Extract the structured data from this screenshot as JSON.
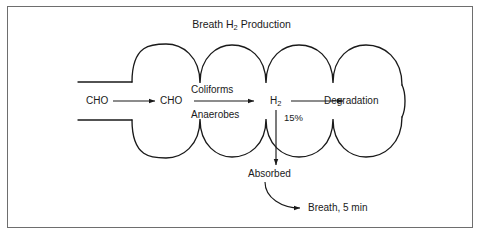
{
  "figure": {
    "title_prefix": "Breath H",
    "title_sub": "2",
    "title_suffix": " Production",
    "border_color": "#6e6e6e",
    "stroke_color": "#1a1a1a",
    "background": "#ffffff"
  },
  "labels": {
    "cho_in": "CHO",
    "cho_lumen": "CHO",
    "coliforms": "Coliforms",
    "anaerobes": "Anaerobes",
    "h2_prefix": "H",
    "h2_sub": "2",
    "percent": "15%",
    "degradation": "Degradation",
    "absorbed": "Absorbed",
    "breath": "Breath, 5 min"
  },
  "diagram_data": {
    "type": "flow-diagram",
    "subject": "Breath hydrogen production in the intestine",
    "nodes": [
      {
        "id": "cho_in",
        "label": "CHO",
        "x": 100,
        "y": 101
      },
      {
        "id": "cho_lumen",
        "label": "CHO",
        "x": 174,
        "y": 101
      },
      {
        "id": "h2",
        "label": "H2",
        "x": 276,
        "y": 101
      },
      {
        "id": "degradation",
        "label": "Degradation",
        "x": 352,
        "y": 101
      },
      {
        "id": "absorbed",
        "label": "Absorbed",
        "x": 271,
        "y": 174
      },
      {
        "id": "breath",
        "label": "Breath, 5 min",
        "x": 340,
        "y": 208
      }
    ],
    "edges": [
      {
        "from": "cho_in",
        "to": "cho_lumen",
        "label": "",
        "style": "straight-arrow"
      },
      {
        "from": "cho_lumen",
        "to": "h2",
        "label": "Coliforms / Anaerobes",
        "style": "straight-arrow"
      },
      {
        "from": "h2",
        "to": "degradation",
        "label": "",
        "style": "straight-arrow"
      },
      {
        "from": "h2",
        "to": "absorbed",
        "label": "15%",
        "style": "down-arrow"
      },
      {
        "from": "absorbed",
        "to": "breath",
        "label": "",
        "style": "curved-arrow"
      }
    ],
    "intestine": {
      "loops": 4,
      "description": "Scalloped tube with four rounded haustra-like loops, open inlet at left and open arc at right"
    }
  }
}
